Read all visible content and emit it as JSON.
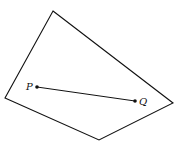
{
  "diagram": {
    "shape": "convex-quadrilateral",
    "vertices": [
      [
        53,
        11
      ],
      [
        173,
        103
      ],
      [
        99,
        140
      ],
      [
        5,
        98
      ]
    ],
    "points": [
      {
        "label": "P",
        "x": 37,
        "y": 87
      },
      {
        "label": "Q",
        "x": 135,
        "y": 101
      }
    ],
    "segment": {
      "from": "P",
      "to": "Q"
    },
    "stroke_color": "#111111"
  }
}
